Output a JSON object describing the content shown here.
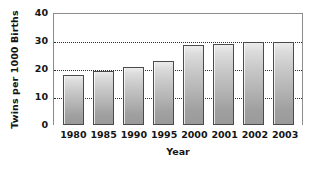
{
  "chart_data": {
    "type": "bar",
    "title": "",
    "xlabel": "Year",
    "ylabel": "Twins per 1000 Births",
    "categories": [
      "1980",
      "1985",
      "1990",
      "1995",
      "2000",
      "2001",
      "2002",
      "2003"
    ],
    "values": [
      17.8,
      19.3,
      20.8,
      22.7,
      28.4,
      28.9,
      29.8,
      29.8
    ],
    "ylim": [
      0,
      40
    ],
    "yticks": [
      0,
      10,
      20,
      30,
      40
    ],
    "ytick_labels": [
      "0",
      "10",
      "20",
      "30",
      "40"
    ],
    "grid": true,
    "gridlines_at": [
      10,
      20,
      30
    ],
    "legend": null,
    "series": [
      {
        "name": "Twins per 1000 Births",
        "values": [
          17.8,
          19.3,
          20.8,
          22.7,
          28.4,
          28.9,
          29.8,
          29.8
        ]
      }
    ],
    "colors": {
      "bar_top": "#ececec",
      "bar_bottom": "#9a9a9a",
      "bar_outline": "#4a4a4a",
      "gridline": "#2b2b2b",
      "frame": "#8c8c8c",
      "text": "#141414",
      "background": "#ffffff"
    }
  }
}
